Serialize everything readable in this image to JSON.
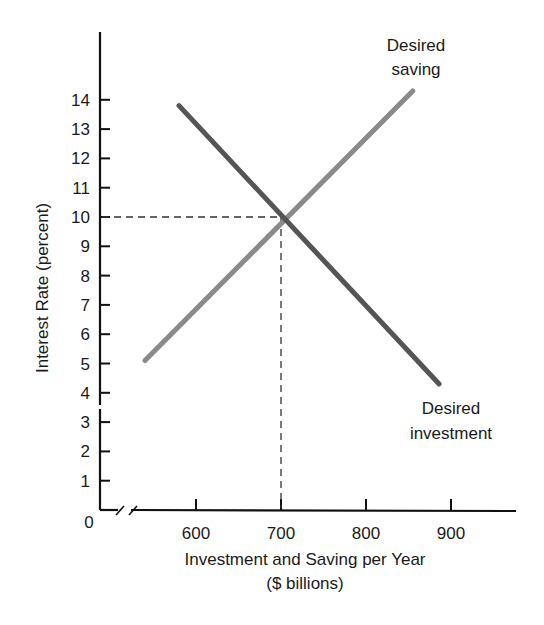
{
  "chart_data": {
    "type": "line",
    "title": "",
    "xlabel": "Investment and Saving per Year",
    "xlabel_units": "($ billions)",
    "ylabel": "Interest Rate (percent)",
    "x_ticks": [
      "600",
      "700",
      "800",
      "900"
    ],
    "x_tick_values": [
      600,
      700,
      800,
      900
    ],
    "y_ticks": [
      "1",
      "2",
      "3",
      "4",
      "5",
      "6",
      "7",
      "8",
      "9",
      "10",
      "11",
      "12",
      "13",
      "14"
    ],
    "y_tick_values": [
      1,
      2,
      3,
      4,
      5,
      6,
      7,
      8,
      9,
      10,
      11,
      12,
      13,
      14
    ],
    "origin_label": "0",
    "x_axis_break": true,
    "y_axis_break_between": [
      3,
      4
    ],
    "ylim": [
      0,
      17
    ],
    "xlim": [
      500,
      980
    ],
    "grid": false,
    "series": [
      {
        "name": "Desired saving",
        "label_lines": [
          "Desired",
          "saving"
        ],
        "color": "#8a8a8a",
        "x": [
          540,
          855
        ],
        "y": [
          5.1,
          14.3
        ]
      },
      {
        "name": "Desired investment",
        "label_lines": [
          "Desired",
          "investment"
        ],
        "color": "#555555",
        "x": [
          580,
          886
        ],
        "y": [
          13.8,
          4.3
        ]
      }
    ],
    "equilibrium": {
      "x": 700,
      "y": 10,
      "guides": "dashed"
    }
  }
}
